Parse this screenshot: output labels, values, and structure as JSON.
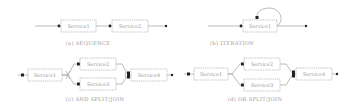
{
  "diagram": {
    "colors": {
      "line": "#a8a8a8",
      "box_border": "#b8b8b8",
      "node": "#222222",
      "text": "#9a9a9a",
      "background": "#ffffff"
    },
    "panels": [
      {
        "id": "sequence",
        "caption": "(a) SEQUENCE",
        "services": [
          "Service1",
          "Service2"
        ]
      },
      {
        "id": "iteration",
        "caption": "(b) ITERATION",
        "services": [
          "Service1"
        ]
      },
      {
        "id": "and-split-join",
        "caption": "(c) AND SPLIT/JOIN",
        "services": [
          "Service1",
          "Service2",
          "Service3",
          "Service4"
        ]
      },
      {
        "id": "or-split-join",
        "caption": "(d) OR SPLIT/JOIN",
        "services": [
          "Service1",
          "Service2",
          "Service3",
          "Service4"
        ]
      }
    ]
  }
}
